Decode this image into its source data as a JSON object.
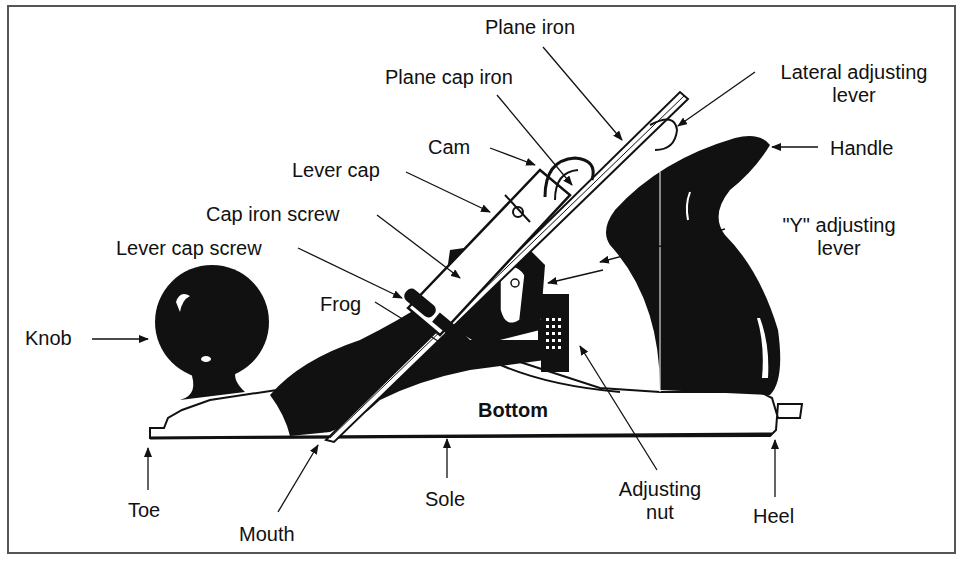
{
  "diagram": {
    "labels": {
      "plane_iron": "Plane iron",
      "plane_cap_iron": "Plane cap iron",
      "lateral_adjusting_lever_1": "Lateral adjusting",
      "lateral_adjusting_lever_2": "lever",
      "cam": "Cam",
      "handle": "Handle",
      "lever_cap": "Lever cap",
      "cap_iron_screw": "Cap iron screw",
      "y_adjusting_lever_1": "\"Y\" adjusting",
      "y_adjusting_lever_2": "lever",
      "lever_cap_screw": "Lever cap screw",
      "frog": "Frog",
      "knob": "Knob",
      "bottom": "Bottom",
      "toe": "Toe",
      "mouth": "Mouth",
      "sole": "Sole",
      "adjusting_nut_1": "Adjusting",
      "adjusting_nut_2": "nut",
      "heel": "Heel"
    },
    "colors": {
      "ink": "#111111",
      "frame": "#555555",
      "paper": "#ffffff"
    }
  }
}
